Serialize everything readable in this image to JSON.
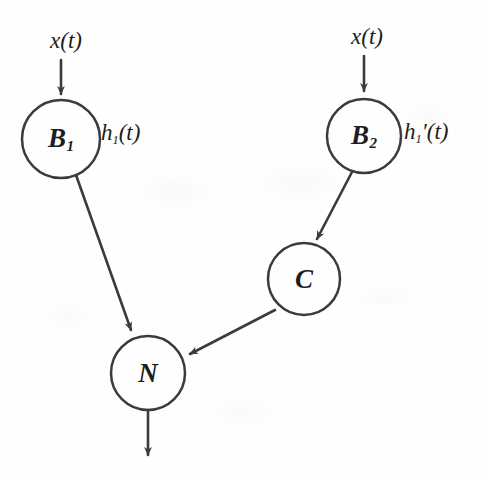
{
  "figure": {
    "type": "block-diagram",
    "title": "",
    "background_color": "#fefefe",
    "ink_color": "#3a3a40"
  },
  "nodes": [
    {
      "id": "B1",
      "label": "B",
      "subscript": "1",
      "cx": 61,
      "cy": 139,
      "r": 39
    },
    {
      "id": "B2",
      "label": "B",
      "subscript": "2",
      "cx": 364,
      "cy": 136,
      "r": 37
    },
    {
      "id": "C",
      "label": "C",
      "subscript": "",
      "cx": 304,
      "cy": 279,
      "r": 36
    },
    {
      "id": "N",
      "label": "N",
      "subscript": "",
      "cx": 148,
      "cy": 373,
      "r": 37
    }
  ],
  "input_labels": [
    {
      "id": "input-left",
      "text": "x(t)",
      "x": 66,
      "y": 41
    },
    {
      "id": "input-right",
      "text": "x(t)",
      "x": 367,
      "y": 37
    }
  ],
  "response_labels": [
    {
      "id": "h1",
      "base": "h",
      "subscript": "1",
      "prime": "",
      "arg": "(t)",
      "x": 101,
      "y": 134
    },
    {
      "id": "h1-prime",
      "base": "h",
      "subscript": "1",
      "prime": "′",
      "arg": "(t)",
      "x": 404,
      "y": 133
    }
  ],
  "edges": [
    {
      "id": "input-to-B1",
      "from": "x(t)",
      "to": "B1",
      "arrow": true
    },
    {
      "id": "input-to-B2",
      "from": "x(t)",
      "to": "B2",
      "arrow": true
    },
    {
      "id": "B1-to-N",
      "from": "B1",
      "to": "N",
      "arrow": true
    },
    {
      "id": "B2-to-C",
      "from": "B2",
      "to": "C",
      "arrow": true
    },
    {
      "id": "C-to-N",
      "from": "C",
      "to": "N",
      "arrow": true
    },
    {
      "id": "N-output",
      "from": "N",
      "to": "",
      "arrow": true
    }
  ]
}
